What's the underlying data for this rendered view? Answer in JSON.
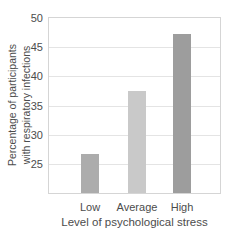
{
  "chart_data": {
    "type": "bar",
    "title": "",
    "categories": [
      "Low",
      "Average",
      "High"
    ],
    "values": [
      26.7,
      37.5,
      47.3
    ],
    "xlabel": "Level of psychological stress",
    "ylabel_line1": "Percentage of participants",
    "ylabel_line2": "with respiratory infections",
    "yticks": [
      25,
      30,
      35,
      40,
      45,
      50
    ],
    "ylim": [
      20,
      50
    ],
    "grid": "horizontal gridlines at each labeled tick",
    "legend": "none",
    "bar_colors": [
      "#acacac",
      "#c9c9c9",
      "#9d9d9d"
    ],
    "bar_centers_px": [
      41,
      88,
      133
    ],
    "bar_width_px": 18,
    "gridline_color": "#e4e4e4",
    "frame_color": "#d5d5d5",
    "text_color": "#4c4c4c",
    "background_color": "#ffffff"
  }
}
